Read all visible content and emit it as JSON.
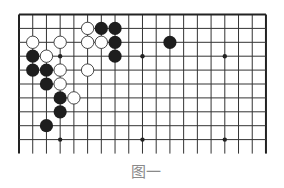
{
  "figure": {
    "caption": "图一",
    "type": "go-board-diagram"
  },
  "board": {
    "size": 19,
    "visible_rows": 10,
    "origin": {
      "x": 19,
      "y": 14.5
    },
    "spacing": {
      "x": 13.72,
      "y": 13.9
    },
    "line_extension_below": 14,
    "line_color": "#333333",
    "edge_color": "#222222",
    "star_points": [
      [
        3,
        3
      ],
      [
        9,
        3
      ],
      [
        15,
        3
      ],
      [
        3,
        9
      ],
      [
        9,
        9
      ],
      [
        15,
        9
      ]
    ]
  },
  "stones": {
    "black_color": "#1e1e1e",
    "white_fill": "#ffffff",
    "white_stroke": "#333333",
    "radius": 6.6,
    "black": [
      [
        6,
        1
      ],
      [
        7,
        1
      ],
      [
        7,
        2
      ],
      [
        11,
        2
      ],
      [
        1,
        3
      ],
      [
        7,
        3
      ],
      [
        1,
        4
      ],
      [
        2,
        4
      ],
      [
        2,
        5
      ],
      [
        3,
        6
      ],
      [
        3,
        7
      ],
      [
        2,
        8
      ]
    ],
    "white": [
      [
        5,
        1
      ],
      [
        1,
        2
      ],
      [
        3,
        2
      ],
      [
        5,
        2
      ],
      [
        6,
        2
      ],
      [
        2,
        3
      ],
      [
        3,
        4
      ],
      [
        5,
        4
      ],
      [
        3,
        5
      ],
      [
        4,
        6
      ]
    ]
  }
}
